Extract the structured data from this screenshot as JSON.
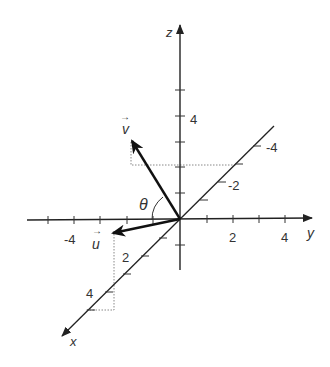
{
  "diagram": {
    "type": "3d-vector-axes",
    "axes": {
      "x": {
        "label": "x",
        "ticks": [
          "2",
          "4"
        ]
      },
      "y": {
        "label": "y",
        "ticks": [
          "-4",
          "2",
          "4"
        ]
      },
      "z": {
        "label": "z",
        "ticks": [
          "4"
        ]
      },
      "x_negative_ticks": [
        "-2",
        "-4"
      ]
    },
    "vectors": [
      {
        "name": "u",
        "label": "u",
        "arrow": "→"
      },
      {
        "name": "v",
        "label": "v",
        "arrow": "→"
      }
    ],
    "angle": {
      "label": "θ"
    },
    "colors": {
      "ink": "#222222",
      "guide": "#888888"
    }
  },
  "labels": {
    "z_axis": "z",
    "y_axis": "y",
    "x_axis": "x",
    "tick_z_4": "4",
    "tick_y_neg4": "-4",
    "tick_y_2": "2",
    "tick_y_4": "4",
    "tick_x_2": "2",
    "tick_x_4": "4",
    "tick_xneg_2": "-2",
    "tick_xneg_4": "-4",
    "vec_u": "u",
    "vec_v": "v",
    "vec_arrow": "→",
    "theta": "θ"
  }
}
